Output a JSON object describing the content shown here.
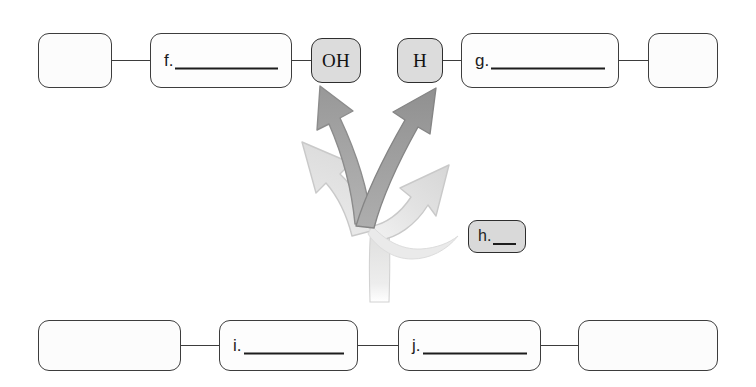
{
  "page": {
    "kind": "fill-in-the-blank concept map worksheet",
    "background_color": "#ffffff",
    "ink_color": "#3d3d3d"
  },
  "top_row": {
    "nodes": [
      {
        "id": "top-blank-left",
        "type": "blank",
        "label": ""
      },
      {
        "id": "top-answer-f",
        "type": "answer",
        "label": "f."
      },
      {
        "id": "top-chip-oh",
        "type": "chip",
        "label": "OH"
      },
      {
        "id": "top-chip-h",
        "type": "chip",
        "label": "H"
      },
      {
        "id": "top-answer-g",
        "type": "answer",
        "label": "g."
      },
      {
        "id": "top-blank-right",
        "type": "blank",
        "label": ""
      }
    ]
  },
  "middle": {
    "chip_answer": {
      "id": "middle-answer-h",
      "type": "chip-answer",
      "label": "h."
    },
    "arrows": {
      "trunk": {
        "name": "arrow-trunk",
        "color": "#e6e6e6"
      },
      "branches": [
        {
          "name": "arrow-branch-up-left-light",
          "direction": "up-left",
          "shade": "light",
          "color": "#e0e0e0",
          "points_to": ""
        },
        {
          "name": "arrow-branch-up-oh-dark",
          "direction": "up",
          "shade": "dark",
          "color": "#9d9d9d",
          "points_to": "OH"
        },
        {
          "name": "arrow-branch-up-h-dark",
          "direction": "up",
          "shade": "dark",
          "color": "#949494",
          "points_to": "H"
        },
        {
          "name": "arrow-branch-up-right-light",
          "direction": "up-right",
          "shade": "light",
          "color": "#dcdcdc",
          "points_to": ""
        }
      ]
    }
  },
  "bottom_row": {
    "nodes": [
      {
        "id": "bottom-blank-left",
        "type": "blank",
        "label": ""
      },
      {
        "id": "bottom-answer-i",
        "type": "answer",
        "label": "i."
      },
      {
        "id": "bottom-answer-j",
        "type": "answer",
        "label": "j."
      },
      {
        "id": "bottom-blank-right",
        "type": "blank",
        "label": ""
      }
    ]
  }
}
